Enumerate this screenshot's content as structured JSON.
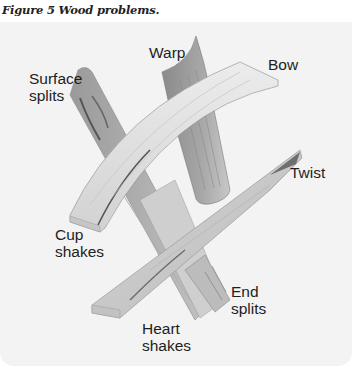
{
  "caption": "Figure 5  Wood problems.",
  "labels": {
    "surface_splits": "Surface\nsplits",
    "warp": "Warp",
    "bow": "Bow",
    "twist": "Twist",
    "cup_shakes": "Cup\nshakes",
    "end_splits": "End\nsplits",
    "heart_shakes": "Heart\nshakes"
  },
  "colors": {
    "panel": "#f3f3f3",
    "wood_light": "#dcdcdc",
    "wood_mid": "#bdbdbd",
    "wood_dark": "#8f8f8f"
  }
}
